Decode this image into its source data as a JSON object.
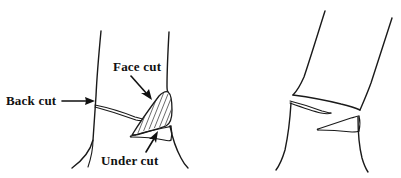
{
  "figure": {
    "background_color": "#ffffff",
    "ink_color": "#1a1a1a",
    "width": 401,
    "height": 178,
    "style": "pen-and-ink line drawing, scanned"
  },
  "labels": [
    {
      "id": "back-cut",
      "text": "Back cut",
      "x": 6,
      "y": 105,
      "arrow": "points right, horizontal, to the left side of the trunk",
      "target": "back cut kerf on the rear of the trunk"
    },
    {
      "id": "face-cut",
      "text": "Face cut",
      "x": 113,
      "y": 71,
      "arrow": "points down-right, diagonal",
      "target": "hatched wedge notch on the face of the trunk"
    },
    {
      "id": "under-cut",
      "text": "Under cut",
      "x": 101,
      "y": 165,
      "arrow": "points up-left, diagonal",
      "target": "thin horizontal undercut sliver below the face wedge"
    }
  ],
  "figures": [
    {
      "id": "left-tree",
      "caption_free": true,
      "description": "Standing tree trunk, vertical, with a back cut on the left side, a hatched triangular face cut wedge on the right side, and a thin under cut beneath the wedge",
      "features": [
        "back cut",
        "face cut wedge (hatched)",
        "under cut"
      ]
    },
    {
      "id": "right-tree",
      "caption_free": true,
      "description": "Tree trunk leaning to the upper right as it begins to fall, showing the opened hinge with two thin wedge slivers where the cuts separated",
      "features": [
        "leaning trunk",
        "open notch",
        "hinge slivers"
      ]
    }
  ]
}
